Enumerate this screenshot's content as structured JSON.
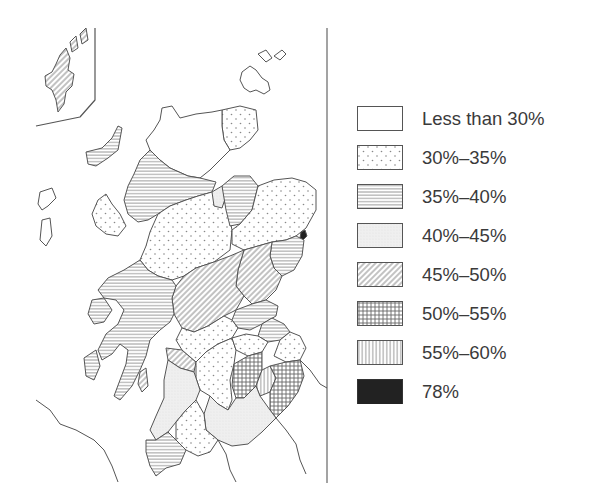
{
  "map": {
    "subject": "Scotland regions choropleth",
    "legend": {
      "items": [
        {
          "label": "Less than 30%",
          "pattern": "blank"
        },
        {
          "label": "30%–35%",
          "pattern": "dots"
        },
        {
          "label": "35%–40%",
          "pattern": "horizontal-lines"
        },
        {
          "label": "40%–45%",
          "pattern": "fine-stipple"
        },
        {
          "label": "45%–50%",
          "pattern": "diagonal-lines"
        },
        {
          "label": "50%–55%",
          "pattern": "crosshatch"
        },
        {
          "label": "55%–60%",
          "pattern": "vertical-lines"
        },
        {
          "label": "78%",
          "pattern": "solid-black"
        }
      ]
    },
    "colors": {
      "outline": "#555555",
      "pattern_ink": "#777777",
      "stipple_fill": "#ececec",
      "solid": "#222222",
      "text": "#3a3a3a"
    }
  }
}
